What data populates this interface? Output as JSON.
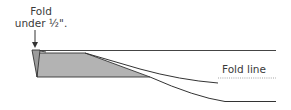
{
  "diagram": {
    "annotations": {
      "fold_under_line1": "Fold",
      "fold_under_line2": "under ½\".",
      "fold_line": "Fold line"
    },
    "colors": {
      "stroke": "#333333",
      "fill": "#b3b3b3",
      "dotted": "#999999",
      "text": "#3a3a3a"
    }
  }
}
